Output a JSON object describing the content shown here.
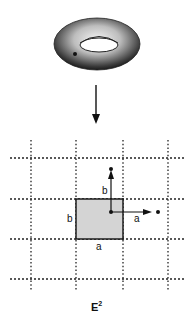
{
  "figure": {
    "surface": "torus",
    "surface_marker": "point",
    "mapping_arrow": "down",
    "plane": {
      "label": "E",
      "label_superscript": "2",
      "grid_style": "dotted",
      "fundamental_domain": {
        "fill": "#d4d4d4",
        "side_labels": {
          "left": "b",
          "bottom": "a"
        }
      },
      "translation_vectors": [
        {
          "name": "a",
          "label": "a",
          "direction": "right"
        },
        {
          "name": "b",
          "label": "b",
          "direction": "up"
        }
      ]
    }
  }
}
